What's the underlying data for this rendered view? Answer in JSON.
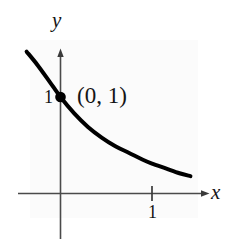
{
  "chart_data": {
    "type": "line",
    "title": "",
    "subtitle": "",
    "xlabel": "x",
    "ylabel": "y",
    "xlim": [
      -0.41,
      1.55
    ],
    "ylim": [
      -0.43,
      1.49
    ],
    "grid": false,
    "legend": null,
    "series": [
      {
        "name": "exponential-decay-curve",
        "color": "#000000",
        "linewidth": 4,
        "x": [
          -0.37,
          -0.25,
          -0.12,
          0.0,
          0.15,
          0.3,
          0.45,
          0.6,
          0.75,
          0.9,
          1.0,
          1.15,
          1.3,
          1.42
        ],
        "y": [
          1.47,
          1.33,
          1.16,
          1.0,
          0.83,
          0.69,
          0.58,
          0.49,
          0.42,
          0.35,
          0.31,
          0.26,
          0.21,
          0.18
        ]
      }
    ],
    "points": [
      {
        "name": "y-intercept",
        "label": "(0, 1)",
        "x": 0,
        "y": 1,
        "marker": "filled-circle",
        "color": "#000000"
      }
    ],
    "x_ticks": [
      {
        "value": 1,
        "label": "1"
      }
    ],
    "y_ticks": [
      {
        "value": 1,
        "label": "1"
      }
    ],
    "axes": {
      "x_axis_label": "x",
      "y_axis_label": "y",
      "x_arrow": true,
      "y_arrow": true,
      "axis_color": "#4a4a4a"
    }
  },
  "annotations": {
    "point_label": "(0, 1)",
    "y_tick_label": "1",
    "x_tick_label": "1",
    "x_axis_name": "x",
    "y_axis_name": "y"
  },
  "colors": {
    "curve": "#000000",
    "axis": "#4a4a4a",
    "background": "#ffffff",
    "panel": "#fbfbfb",
    "text": "#151515"
  }
}
